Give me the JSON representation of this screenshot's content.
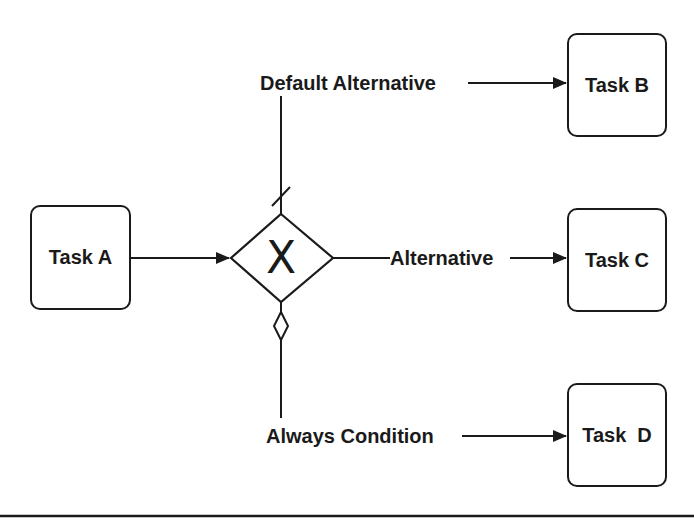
{
  "diagram": {
    "type": "BPMN exclusive gateway",
    "colors": {
      "stroke": "#1a1a1a",
      "background": "#ffffff"
    },
    "tasks": [
      {
        "id": "task-a",
        "label": "Task A"
      },
      {
        "id": "task-b",
        "label": "Task B"
      },
      {
        "id": "task-c",
        "label": "Task C"
      },
      {
        "id": "task-d",
        "label": "Task  D"
      }
    ],
    "gateway": {
      "type": "exclusive",
      "marker": "X"
    },
    "flows": [
      {
        "from": "Task A",
        "to": "gateway",
        "label": ""
      },
      {
        "from": "gateway",
        "to": "Task B",
        "label": "Default Alternative",
        "marker": "default-slash"
      },
      {
        "from": "gateway",
        "to": "Task C",
        "label": "Alternative"
      },
      {
        "from": "gateway",
        "to": "Task D",
        "label": "Always Condition",
        "marker": "conditional-diamond"
      }
    ]
  }
}
